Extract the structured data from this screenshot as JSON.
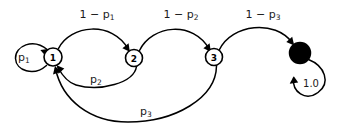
{
  "diagram": {
    "type": "markov-chain-state-transition-diagram",
    "background_color": "#ffffff",
    "stroke_color": "#000000",
    "nodes": [
      {
        "id": "s1",
        "label": "1",
        "kind": "open-circle",
        "cx": 53,
        "cy": 57,
        "r": 9
      },
      {
        "id": "s2",
        "label": "2",
        "kind": "open-circle",
        "cx": 134,
        "cy": 58,
        "r": 8.5
      },
      {
        "id": "s3",
        "label": "3",
        "kind": "open-circle",
        "cx": 214,
        "cy": 57,
        "r": 8.5
      },
      {
        "id": "s4",
        "label": "",
        "kind": "filled-circle",
        "cx": 300,
        "cy": 53,
        "r": 10.5
      }
    ],
    "edges": [
      {
        "id": "e-self-1",
        "from": "s1",
        "to": "s1",
        "label_main": "p",
        "label_sub": "1",
        "label_x": 24,
        "label_y": 57
      },
      {
        "id": "e-1-2",
        "from": "s1",
        "to": "s2",
        "label_main": "1 − p",
        "label_sub": "1",
        "label_x": 97,
        "label_y": 14
      },
      {
        "id": "e-2-1",
        "from": "s2",
        "to": "s1",
        "label_main": "p",
        "label_sub": "2",
        "label_x": 96,
        "label_y": 79
      },
      {
        "id": "e-2-3",
        "from": "s2",
        "to": "s3",
        "label_main": "1 − p",
        "label_sub": "2",
        "label_x": 181,
        "label_y": 14
      },
      {
        "id": "e-3-1",
        "from": "s3",
        "to": "s1",
        "label_main": "p",
        "label_sub": "3",
        "label_x": 146,
        "label_y": 111
      },
      {
        "id": "e-3-4",
        "from": "s3",
        "to": "s4",
        "label_main": "1 − p",
        "label_sub": "3",
        "label_x": 263,
        "label_y": 14
      },
      {
        "id": "e-self-4",
        "from": "s4",
        "to": "s4",
        "label_main": "1.0",
        "label_sub": "",
        "label_x": 311,
        "label_y": 83
      }
    ]
  }
}
